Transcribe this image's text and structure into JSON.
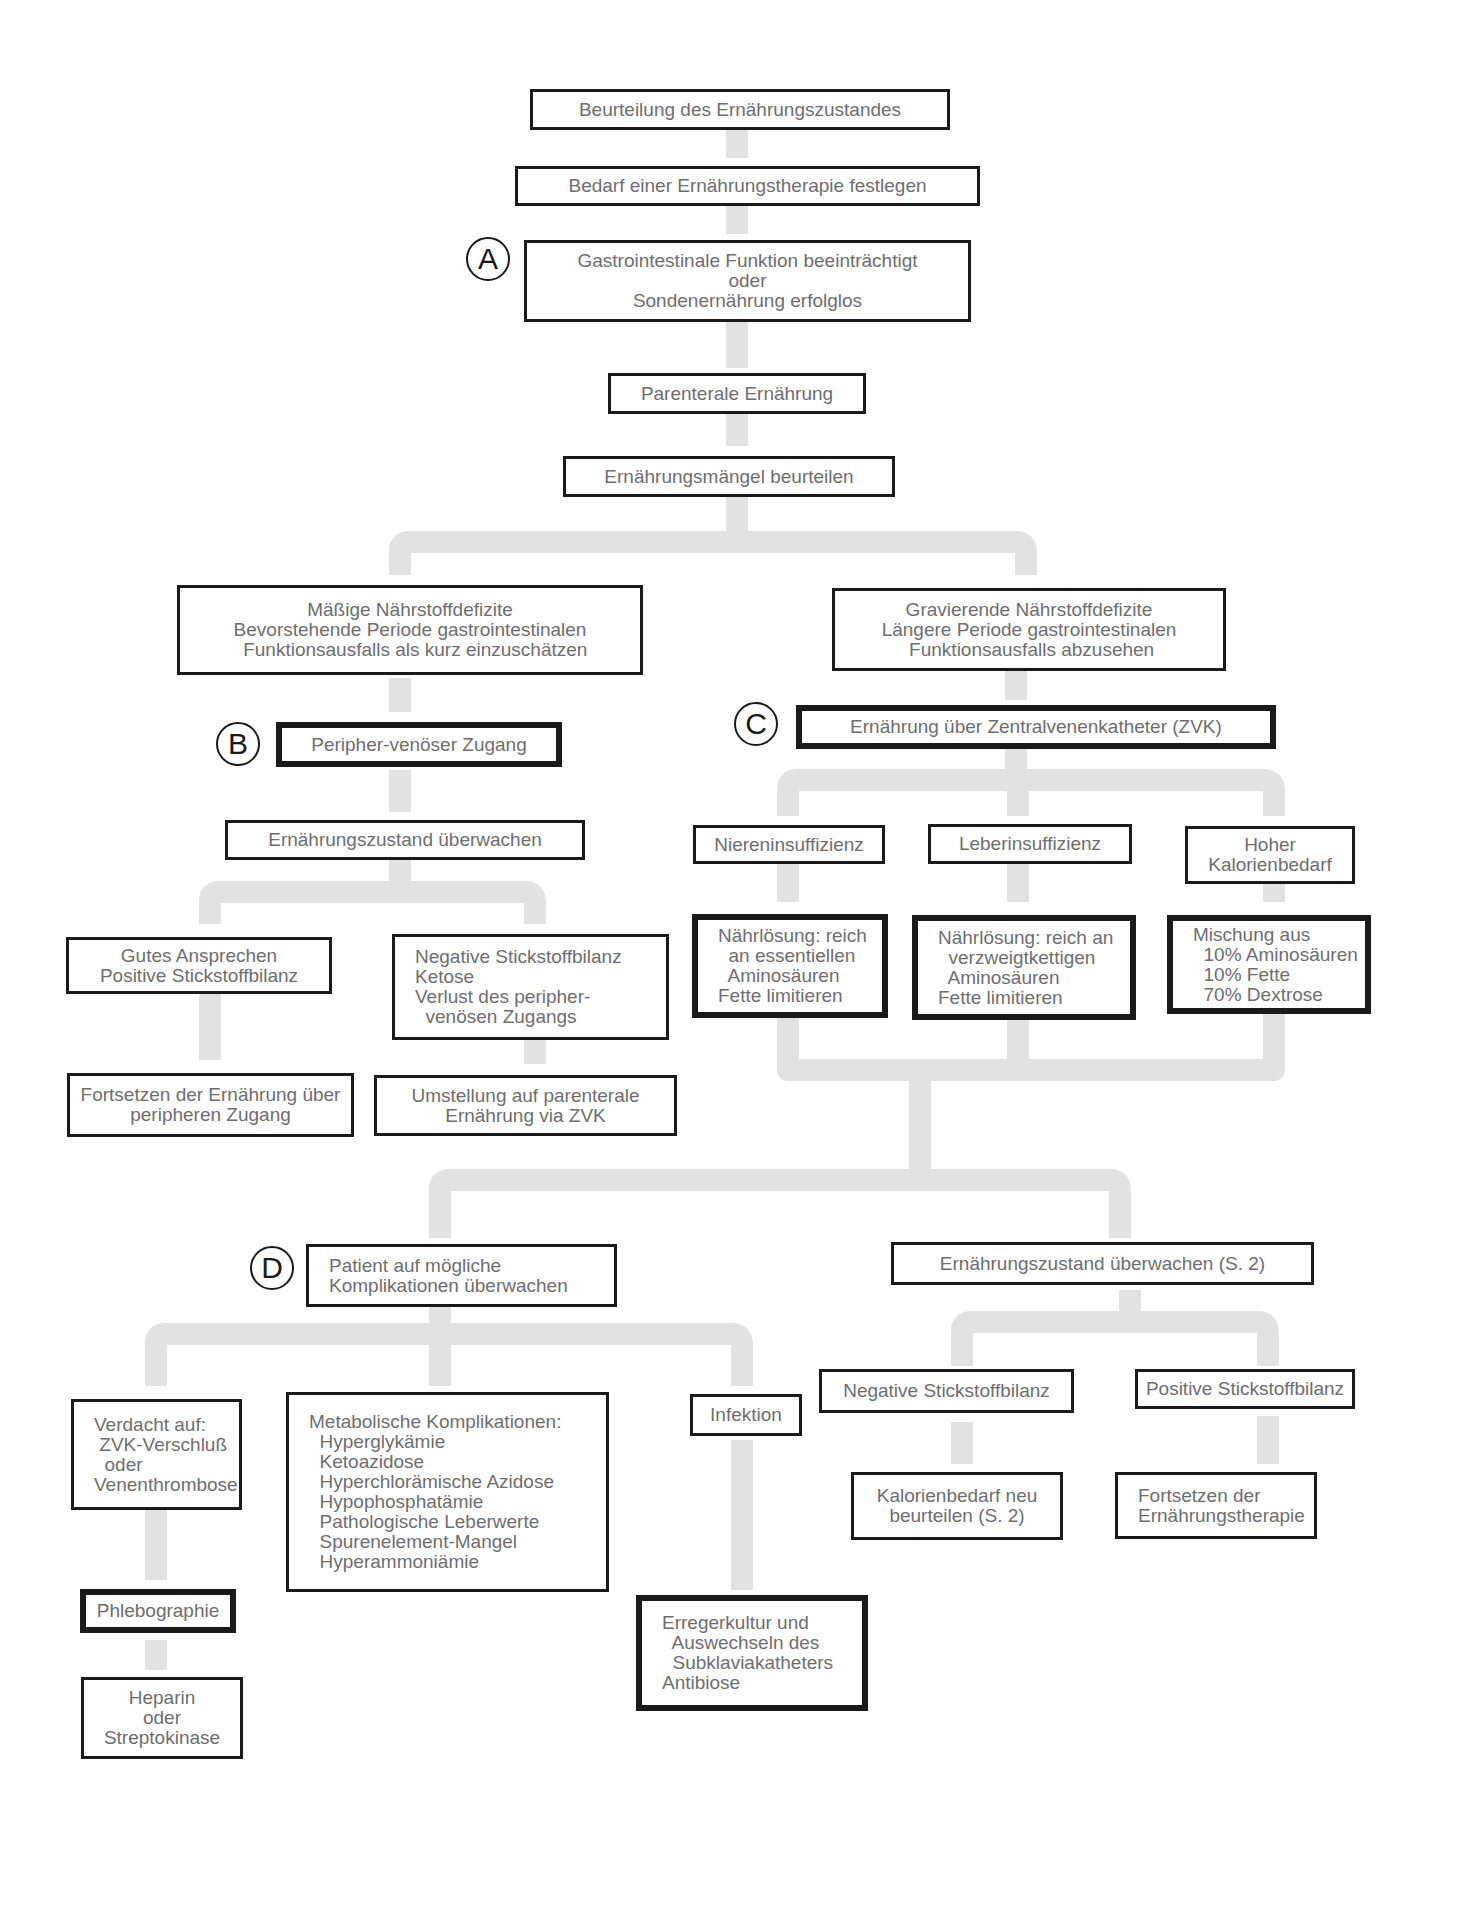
{
  "diagram": {
    "type": "flowchart",
    "topic": "Parenterale Ernährung – Entscheidungsbaum",
    "connector_color": "#e2e2e2",
    "box_border_color": "#1a1a1a",
    "text_color": "#6e6e6e"
  },
  "badges": {
    "a": "A",
    "b": "B",
    "c": "C",
    "d": "D"
  },
  "nodes": {
    "n1": {
      "lines": [
        "Beurteilung des Ernährungszustandes"
      ]
    },
    "n2": {
      "lines": [
        "Bedarf einer Ernährungstherapie festlegen"
      ]
    },
    "n3": {
      "lines": [
        "Gastrointestinale Funktion beeinträchtigt",
        "oder",
        "Sondenernährung erfolglos"
      ]
    },
    "n4": {
      "lines": [
        "Parenterale Ernährung"
      ]
    },
    "n5": {
      "lines": [
        "Ernährungsmängel beurteilen"
      ]
    },
    "n6": {
      "lines": [
        "Mäßige Nährstoffdefizite",
        "Bevorstehende Periode gastrointestinalen",
        "  Funktionsausfalls als kurz einzuschätzen"
      ]
    },
    "n7": {
      "lines": [
        "Gravierende Nährstoffdefizite",
        "Längere Periode gastrointestinalen",
        " Funktionsausfalls abzusehen"
      ]
    },
    "n8": {
      "lines": [
        "Peripher-venöser Zugang"
      ]
    },
    "n9": {
      "lines": [
        "Ernährung über Zentralvenenkatheter (ZVK)"
      ]
    },
    "n10": {
      "lines": [
        "Ernährungszustand überwachen"
      ]
    },
    "n11": {
      "lines": [
        "Gutes Ansprechen",
        "Positive Stickstoffbilanz"
      ]
    },
    "n12": {
      "lines": [
        "Negative Stickstoffbilanz",
        "Ketose",
        "Verlust des peripher-",
        "  venösen Zugangs"
      ]
    },
    "n13": {
      "lines": [
        "Fortsetzen der Ernährung über",
        "peripheren Zugang"
      ]
    },
    "n14": {
      "lines": [
        "Umstellung auf parenterale",
        "Ernährung via ZVK"
      ]
    },
    "n15": {
      "lines": [
        "Niereninsuffizienz"
      ]
    },
    "n16": {
      "lines": [
        "Leberinsuffizienz"
      ]
    },
    "n17": {
      "lines": [
        "Hoher",
        "Kalorienbedarf"
      ]
    },
    "n18": {
      "lines": [
        "Nährlösung: reich",
        "  an essentiellen",
        "  Aminosäuren",
        "Fette limitieren"
      ]
    },
    "n19": {
      "lines": [
        "Nährlösung: reich an",
        "  verzweigtkettigen",
        "  Aminosäuren",
        "Fette limitieren"
      ]
    },
    "n20": {
      "lines": [
        "Mischung aus",
        "  10% Aminosäuren",
        "  10% Fette",
        "  70% Dextrose"
      ]
    },
    "n21": {
      "lines": [
        "Patient auf mögliche",
        "Komplikationen überwachen"
      ]
    },
    "n22": {
      "lines": [
        "Ernährungszustand überwachen (S. 2)"
      ]
    },
    "n23": {
      "lines": [
        "Verdacht auf:",
        " ZVK-Verschluß",
        "  oder",
        "Venenthrombose"
      ]
    },
    "n24": {
      "lines": [
        "Metabolische Komplikationen:",
        "  Hyperglykämie",
        "  Ketoazidose",
        "  Hyperchlorämische Azidose",
        "  Hypophosphatämie",
        "  Pathologische Leberwerte",
        "  Spurenelement-Mangel",
        "  Hyperammoniämie"
      ]
    },
    "n25": {
      "lines": [
        "Infektion"
      ]
    },
    "n26": {
      "lines": [
        "Negative Stickstoffbilanz"
      ]
    },
    "n27": {
      "lines": [
        "Positive Stickstoffbilanz"
      ]
    },
    "n28": {
      "lines": [
        "Phlebographie"
      ]
    },
    "n29": {
      "lines": [
        "Erregerkultur und",
        "  Auswechseln des",
        "  Subklaviakatheters",
        "Antibiose"
      ]
    },
    "n30": {
      "lines": [
        "Kalorienbedarf neu",
        "beurteilen (S. 2)"
      ]
    },
    "n31": {
      "lines": [
        "Fortsetzen der",
        "Ernährungstherapie"
      ]
    },
    "n32": {
      "lines": [
        "Heparin",
        "oder",
        "Streptokinase"
      ]
    }
  }
}
